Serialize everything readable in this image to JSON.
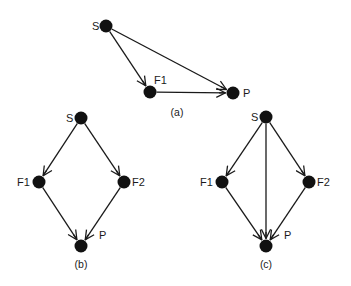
{
  "diagram": {
    "colors": {
      "ink": "#111111",
      "background": "#ffffff"
    },
    "panels": [
      {
        "id": "a",
        "caption": "(a)",
        "caption_pos": [
          177,
          116
        ],
        "nodes": [
          {
            "id": "S",
            "label": "S",
            "x": 106,
            "y": 26,
            "label_dx": -14,
            "label_dy": 4
          },
          {
            "id": "F1",
            "label": "F1",
            "x": 150,
            "y": 92,
            "label_dx": 4,
            "label_dy": -8
          },
          {
            "id": "P",
            "label": "P",
            "x": 233,
            "y": 93,
            "label_dx": 10,
            "label_dy": 4
          }
        ],
        "edges": [
          {
            "from": "S",
            "to": "F1"
          },
          {
            "from": "S",
            "to": "P"
          },
          {
            "from": "F1",
            "to": "P"
          }
        ]
      },
      {
        "id": "b",
        "caption": "(b)",
        "caption_pos": [
          81,
          268
        ],
        "nodes": [
          {
            "id": "S",
            "label": "S",
            "x": 81,
            "y": 118,
            "label_dx": -15,
            "label_dy": 4
          },
          {
            "id": "F1",
            "label": "F1",
            "x": 39,
            "y": 182,
            "label_dx": -22,
            "label_dy": 4
          },
          {
            "id": "F2",
            "label": "F2",
            "x": 124,
            "y": 182,
            "label_dx": 8,
            "label_dy": 4
          },
          {
            "id": "P",
            "label": "P",
            "x": 81,
            "y": 246,
            "label_dx": 18,
            "label_dy": -7
          }
        ],
        "edges": [
          {
            "from": "S",
            "to": "F1"
          },
          {
            "from": "S",
            "to": "F2"
          },
          {
            "from": "F1",
            "to": "P"
          },
          {
            "from": "F2",
            "to": "P"
          }
        ]
      },
      {
        "id": "c",
        "caption": "(c)",
        "caption_pos": [
          266,
          268
        ],
        "nodes": [
          {
            "id": "S",
            "label": "S",
            "x": 266,
            "y": 117,
            "label_dx": -15,
            "label_dy": 4
          },
          {
            "id": "F1",
            "label": "F1",
            "x": 222,
            "y": 182,
            "label_dx": -22,
            "label_dy": 4
          },
          {
            "id": "F2",
            "label": "F2",
            "x": 309,
            "y": 182,
            "label_dx": 8,
            "label_dy": 4
          },
          {
            "id": "P",
            "label": "P",
            "x": 266,
            "y": 246,
            "label_dx": 18,
            "label_dy": -7
          }
        ],
        "edges": [
          {
            "from": "S",
            "to": "F1"
          },
          {
            "from": "S",
            "to": "F2"
          },
          {
            "from": "S",
            "to": "P"
          },
          {
            "from": "F1",
            "to": "P"
          },
          {
            "from": "F2",
            "to": "P"
          }
        ]
      }
    ]
  }
}
